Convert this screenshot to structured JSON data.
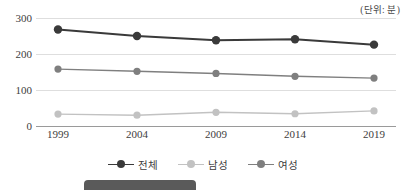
{
  "chart_data": {
    "type": "line",
    "title": "",
    "subtitle": "",
    "unit_caption": "(단위: 분)",
    "xlabel": "",
    "ylabel": "",
    "categories": [
      "1999",
      "2004",
      "2009",
      "2014",
      "2019"
    ],
    "ylim": [
      0,
      300
    ],
    "yticks": [
      0,
      100,
      200,
      300
    ],
    "grid": true,
    "legend_position": "bottom",
    "series": [
      {
        "name": "전체",
        "color": "#3a3a3a",
        "values": [
          268,
          250,
          238,
          241,
          226
        ]
      },
      {
        "name": "남성",
        "color": "#c2c2c2",
        "values": [
          33,
          30,
          38,
          34,
          42
        ]
      },
      {
        "name": "여성",
        "color": "#7f7f7f",
        "values": [
          158,
          152,
          146,
          138,
          133
        ]
      }
    ]
  },
  "colors": {
    "gridline": "#dedede",
    "baseline": "#9a9a9a",
    "text": "#3d3d3d",
    "bottom_bar": "#5a5a5a"
  },
  "bottom_bar": {
    "label": ""
  }
}
